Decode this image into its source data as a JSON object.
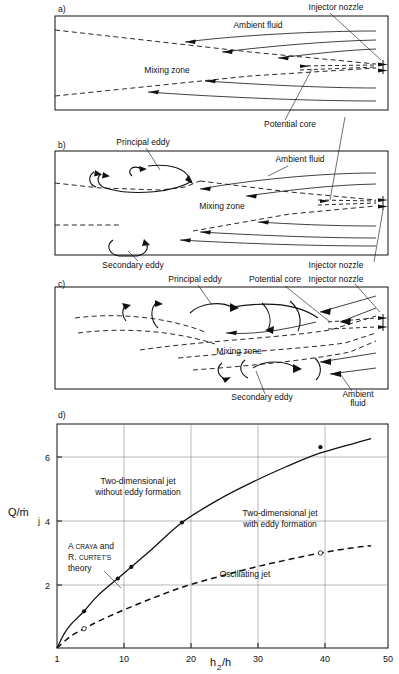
{
  "figure": {
    "panels": [
      {
        "id": "a)",
        "labels": [
          {
            "name": "injector-nozzle",
            "text": "Injector nozzle"
          },
          {
            "name": "ambient-fluid",
            "text": "Ambient fluid"
          },
          {
            "name": "mixing-zone",
            "text": "Mixing zone"
          },
          {
            "name": "potential-core",
            "text": "Potential core"
          }
        ]
      },
      {
        "id": "b)",
        "labels": [
          {
            "name": "principal-eddy",
            "text": "Principal eddy"
          },
          {
            "name": "ambient-fluid",
            "text": "Ambient fluid"
          },
          {
            "name": "mixing-zone",
            "text": "Mixing zone"
          },
          {
            "name": "secondary-eddy",
            "text": "Secondary eddy"
          },
          {
            "name": "injector-nozzle",
            "text": "Injector nozzle"
          }
        ]
      },
      {
        "id": "c)",
        "labels": [
          {
            "name": "principal-eddy",
            "text": "Principal eddy"
          },
          {
            "name": "potential-core",
            "text": "Potential core"
          },
          {
            "name": "mixing-zone",
            "text": "Mixing zone"
          },
          {
            "name": "secondary-eddy",
            "text": "Secondary eddy"
          },
          {
            "name": "ambient-fluid-1",
            "text": "Ambient"
          },
          {
            "name": "ambient-fluid-2",
            "text": "fluid"
          }
        ]
      },
      {
        "id": "d)"
      }
    ]
  },
  "chart_data": {
    "type": "line",
    "title": "",
    "xlabel": "h2/h",
    "xlabel_parts": {
      "base1": "h",
      "sub": "2",
      "base2": "/h"
    },
    "ylabel": "Q/ṁj",
    "ylabel_parts": {
      "main": "Q/ṁ",
      "sub": "j"
    },
    "xlim": [
      1,
      50
    ],
    "ylim": [
      1,
      6.8
    ],
    "xticks": [
      1,
      10,
      20,
      30,
      40,
      50
    ],
    "xtick_labels": [
      "1",
      "10",
      "20",
      "30",
      "40",
      "50"
    ],
    "yticks": [
      2,
      4,
      6
    ],
    "ytick_labels": [
      "2",
      "4",
      "6"
    ],
    "grid": true,
    "legend_position": "inline-annotations",
    "series": [
      {
        "name": "Craya-Curtet transition (two-dimensional jet)",
        "style": "solid",
        "marker": "filled-circle",
        "x": [
          1,
          2,
          3,
          5,
          7,
          10,
          12,
          15,
          19.5,
          25,
          30,
          35,
          40,
          45,
          47.5
        ],
        "y": [
          1.0,
          1.35,
          1.6,
          1.95,
          2.35,
          2.8,
          3.1,
          3.55,
          4.25,
          4.85,
          5.3,
          5.7,
          6.05,
          6.3,
          6.42
        ],
        "points": [
          {
            "x": 5,
            "y": 1.95
          },
          {
            "x": 10,
            "y": 2.8
          },
          {
            "x": 12,
            "y": 3.1
          },
          {
            "x": 19.5,
            "y": 4.25
          },
          {
            "x": 40,
            "y": 6.2
          }
        ]
      },
      {
        "name": "Oscillating jet boundary",
        "style": "dashed",
        "marker": "open-circle",
        "x": [
          1,
          3,
          5,
          7,
          10,
          15,
          20,
          25,
          30,
          35,
          40,
          45,
          47.5
        ],
        "y": [
          1.0,
          1.3,
          1.5,
          1.68,
          1.92,
          2.28,
          2.6,
          2.85,
          3.08,
          3.28,
          3.46,
          3.6,
          3.65
        ],
        "points": [
          {
            "x": 5,
            "y": 1.5
          },
          {
            "x": 40,
            "y": 3.46
          }
        ]
      }
    ],
    "annotations": [
      {
        "name": "region-without-eddy",
        "lines": [
          "Two-dimensional jet",
          "without eddy formation"
        ]
      },
      {
        "name": "region-with-eddy",
        "lines": [
          "Two-dimensional jet",
          "with eddy formation"
        ]
      },
      {
        "name": "theory-credit",
        "lines": [
          "A CRAYA and",
          "R. CURTET'S",
          "theory"
        ],
        "parts": {
          "l1a": "A ",
          "l1b": "CRAYA",
          "l1c": " and",
          "l2a": "R. ",
          "l2b": "CURTET'S",
          "l3": "theory"
        }
      },
      {
        "name": "region-oscillating",
        "lines": [
          "Oscillating jet"
        ]
      }
    ]
  }
}
